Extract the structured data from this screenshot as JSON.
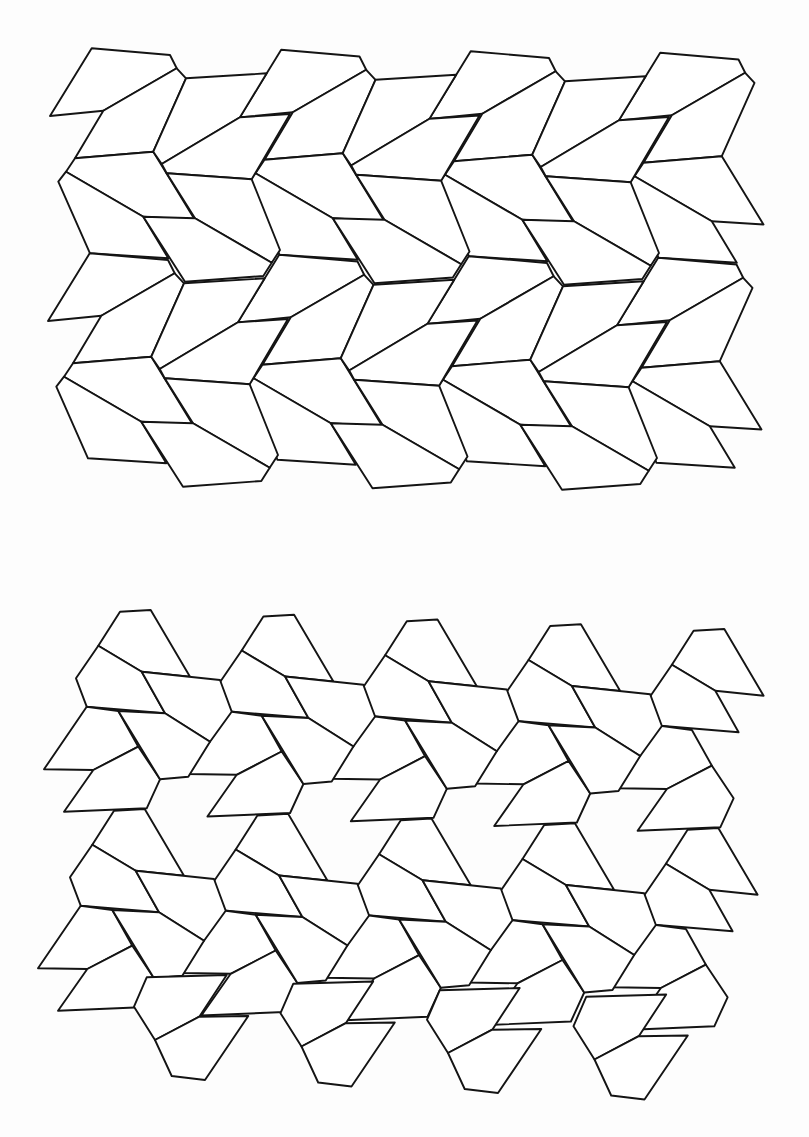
{
  "page": {
    "header_text": "",
    "background": "#fdfdfd",
    "line_color": "#141414"
  },
  "figures": [
    {
      "id": "upper-tiling",
      "description": "Periodic pentagon tiling, chevron rows",
      "lattice": {
        "a": [
          189.5,
          1.5
        ],
        "b": [
          -2,
          205
        ]
      },
      "prototiles": {
        "P1": [
          [
            91.7,
            48.3
          ],
          [
            170,
            55
          ],
          [
            176.7,
            68.3
          ],
          [
            103.3,
            110.7
          ],
          [
            50,
            116
          ]
        ],
        "P2": [
          [
            103.3,
            110.7
          ],
          [
            176.7,
            68.3
          ],
          [
            186,
            78.3
          ],
          [
            153.3,
            151.7
          ],
          [
            75,
            158.3
          ]
        ],
        "P3": [
          [
            75,
            158.3
          ],
          [
            153.3,
            151.7
          ],
          [
            195,
            220
          ],
          [
            143.3,
            216.7
          ],
          [
            66,
            171.7
          ]
        ],
        "P4": [
          [
            66,
            171.7
          ],
          [
            143.3,
            216.7
          ],
          [
            168.3,
            258.3
          ],
          [
            90,
            253.3
          ],
          [
            58.3,
            181.7
          ]
        ],
        "R1": [
          [
            186,
            78.3
          ],
          [
            266.7,
            73.3
          ],
          [
            240,
            117.3
          ],
          [
            161.7,
            164
          ],
          [
            153.3,
            151.7
          ]
        ],
        "R2": [
          [
            161.7,
            164
          ],
          [
            240,
            117.3
          ],
          [
            290,
            114
          ],
          [
            251.7,
            179.3
          ],
          [
            166.7,
            173.3
          ]
        ],
        "R3": [
          [
            166.7,
            173.3
          ],
          [
            251.7,
            179.3
          ],
          [
            280,
            250
          ],
          [
            271.7,
            262.7
          ],
          [
            195,
            218.3
          ]
        ],
        "R4": [
          [
            143.3,
            216.7
          ],
          [
            195,
            218.3
          ],
          [
            271.7,
            262.7
          ],
          [
            263.3,
            276
          ],
          [
            185,
            281.7
          ]
        ]
      },
      "placements": [
        {
          "tiles": [
            "P1",
            "P2",
            "P3",
            "P4"
          ],
          "i": [
            0,
            1,
            2,
            3
          ],
          "j": [
            0,
            1
          ]
        },
        {
          "tiles": [
            "R1",
            "R2",
            "R3"
          ],
          "i": [
            0,
            1,
            2
          ],
          "j": [
            0,
            1
          ]
        },
        {
          "tiles": [
            "R4"
          ],
          "i": [
            0,
            1,
            2
          ],
          "j": [
            0,
            1
          ]
        }
      ]
    },
    {
      "id": "lower-tiling",
      "description": "Periodic pentagon tiling, zigzag rows",
      "lattice": {
        "a": [
          143.4,
          4.75
        ],
        "b": [
          -6,
          199
        ]
      },
      "prototiles": {
        "Q1": [
          [
            120,
            611.7
          ],
          [
            150.7,
            610
          ],
          [
            190,
            676.7
          ],
          [
            141.7,
            671.7
          ],
          [
            98.3,
            645.7
          ]
        ],
        "Q2": [
          [
            98.3,
            645.7
          ],
          [
            141.7,
            671.7
          ],
          [
            165,
            713.3
          ],
          [
            86.7,
            706.7
          ],
          [
            76,
            678.3
          ]
        ],
        "Q3": [
          [
            141.7,
            671.7
          ],
          [
            220,
            680
          ],
          [
            231.7,
            711.7
          ],
          [
            210,
            741.7
          ],
          [
            165,
            713.3
          ]
        ],
        "Q4": [
          [
            118.3,
            711
          ],
          [
            165,
            713.3
          ],
          [
            210,
            741.7
          ],
          [
            188.3,
            776.7
          ],
          [
            160,
            779.3
          ]
        ],
        "Q5": [
          [
            86.7,
            706.7
          ],
          [
            118.3,
            711
          ],
          [
            138.3,
            746.7
          ],
          [
            93.3,
            770
          ],
          [
            44,
            769.3
          ]
        ],
        "Q6": [
          [
            93.3,
            770
          ],
          [
            138.3,
            746.7
          ],
          [
            160,
            779.3
          ],
          [
            146.7,
            808.3
          ],
          [
            64,
            811.7
          ]
        ]
      },
      "placements": [
        {
          "tiles": [
            "Q1",
            "Q2",
            "Q5",
            "Q6"
          ],
          "i": [
            0,
            1,
            2,
            3,
            4
          ],
          "j": [
            0,
            1
          ]
        },
        {
          "tiles": [
            "Q3",
            "Q4"
          ],
          "i": [
            0,
            1,
            2,
            3
          ],
          "j": [
            0,
            1
          ]
        }
      ],
      "bottom_band": {
        "step": [
          146.5,
          6.5
        ],
        "count": 4,
        "prototiles": {
          "X": [
            [
              146.7,
              977.3
            ],
            [
              226.7,
              975
            ],
            [
              199.3,
              1016.7
            ],
            [
              155,
              1040
            ],
            [
              134,
              1006.7
            ]
          ],
          "Y": [
            [
              155,
              1040
            ],
            [
              199.3,
              1016.7
            ],
            [
              248.3,
              1016
            ],
            [
              205,
              1080
            ],
            [
              171.7,
              1076
            ]
          ]
        }
      }
    }
  ]
}
